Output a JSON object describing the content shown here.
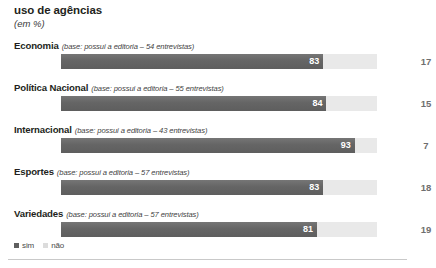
{
  "header": {
    "title": "uso de agências",
    "unit": "(em %)"
  },
  "legend": {
    "position": "bottom-left",
    "items": [
      {
        "label": "sim",
        "swatch": "dark-square-swatch",
        "color": "#5f5f5f"
      },
      {
        "label": "não",
        "swatch": "light-square-swatch",
        "color": "#dcdcdc"
      }
    ]
  },
  "chart_data": {
    "type": "bar",
    "orientation": "horizontal",
    "stacked": true,
    "title": "uso de agências",
    "subtitle": "(em %)",
    "xlabel": "",
    "ylabel": "",
    "xlim": [
      0,
      100
    ],
    "grid": false,
    "legend_position": "bottom-left",
    "categories": [
      "Economia",
      "Política Nacional",
      "Internacional",
      "Esportes",
      "Variedades"
    ],
    "category_notes": [
      "(base: possui a editoria – 54 entrevistas)",
      "(base: possui a editoria – 55 entrevistas)",
      "(base: possui a editoria – 43 entrevistas)",
      "(base: possui a editoria – 57 entrevistas)",
      "(base: possui a editoria – 57 entrevistas)"
    ],
    "series": [
      {
        "name": "sim",
        "values": [
          83,
          84,
          93,
          83,
          81
        ]
      },
      {
        "name": "não",
        "values": [
          17,
          15,
          7,
          18,
          19
        ]
      }
    ]
  },
  "rows": [
    {
      "category": "Economia",
      "note": "(base: possui a editoria – 54 entrevistas)",
      "sim": 83,
      "nao": 17,
      "sim_label": "83",
      "nao_label": "17"
    },
    {
      "category": "Política Nacional",
      "note": "(base: possui a editoria – 55 entrevistas)",
      "sim": 84,
      "nao": 15,
      "sim_label": "84",
      "nao_label": "15"
    },
    {
      "category": "Internacional",
      "note": "(base: possui a editoria – 43 entrevistas)",
      "sim": 93,
      "nao": 7,
      "sim_label": "93",
      "nao_label": "7"
    },
    {
      "category": "Esportes",
      "note": "(base: possui a editoria – 57 entrevistas)",
      "sim": 83,
      "nao": 18,
      "sim_label": "83",
      "nao_label": "18"
    },
    {
      "category": "Variedades",
      "note": "(base: possui a editoria – 57 entrevistas)",
      "sim": 81,
      "nao": 19,
      "sim_label": "81",
      "nao_label": "19"
    }
  ],
  "colors": {
    "bar_fill": "#686868",
    "bar_track": "#e9e9e9",
    "fill_value_text": "#ffffff",
    "rest_value_text": "#6f6f6f",
    "rule": "#c9c9c9"
  }
}
